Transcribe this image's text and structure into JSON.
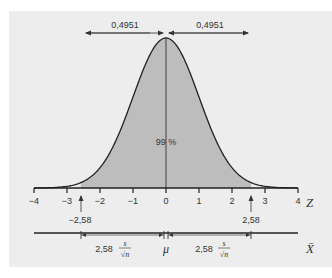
{
  "chart_data": {
    "type": "area",
    "title": "",
    "xlabel": "Z",
    "secondary_xlabel": "X̄",
    "x_ticks": [
      "-4",
      "-3",
      "-2",
      "-1",
      "0",
      "1",
      "2",
      "3",
      "4"
    ],
    "xlim": [
      -4,
      4
    ],
    "distribution": "standard normal",
    "shaded_interval": [
      -2.58,
      2.58
    ],
    "center_label": "99 %",
    "top_annotations": [
      {
        "label": "0,4951",
        "from": -2.58,
        "to": 0
      },
      {
        "label": "0,4951",
        "from": 0,
        "to": 2.58
      }
    ],
    "critical_values": [
      {
        "label": "-2,58",
        "z": -2.58
      },
      {
        "label": "2,58",
        "z": 2.58
      }
    ],
    "bottom_annotations": [
      {
        "label": "2,58",
        "numerator": "s",
        "denominator": "√n",
        "from": -2.58,
        "to": 0
      },
      {
        "label": "2,58",
        "numerator": "s",
        "denominator": "√n",
        "from": 0,
        "to": 2.58
      }
    ],
    "mu_label": "μ"
  },
  "labels": {
    "top_left": "0,4951",
    "top_right": "0,4951",
    "center": "99 %",
    "z_axis": "Z",
    "x_bar_axis": "X̄",
    "crit_left": "−2,58",
    "crit_right": "2,58",
    "mu": "μ",
    "se_left_coef": "2,58",
    "se_right_coef": "2,58",
    "se_num": "s",
    "se_den": "√n",
    "ticks": [
      "−4",
      "−3",
      "−2",
      "−1",
      "0",
      "1",
      "2",
      "3",
      "4"
    ]
  }
}
